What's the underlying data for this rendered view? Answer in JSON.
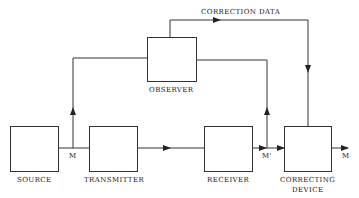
{
  "diagram": {
    "blocks": [
      {
        "id": "source",
        "label": "SOURCE"
      },
      {
        "id": "transmitter",
        "label": "TRANSMITTER"
      },
      {
        "id": "receiver",
        "label": "RECEIVER"
      },
      {
        "id": "observer",
        "label": "OBSERVER"
      },
      {
        "id": "correcting_device",
        "label_line1": "CORRECTING",
        "label_line2": "DEVICE"
      }
    ],
    "signals": {
      "source_out": "M",
      "receiver_out": "M'",
      "corrected_out": "M",
      "correction_link": "CORRECTION DATA"
    },
    "edges": [
      {
        "from": "source",
        "to": "transmitter",
        "label": "M"
      },
      {
        "from": "source",
        "to": "observer",
        "label": "M"
      },
      {
        "from": "transmitter",
        "to": "receiver"
      },
      {
        "from": "receiver",
        "to": "observer",
        "label": "M'"
      },
      {
        "from": "receiver",
        "to": "correcting_device",
        "label": "M'"
      },
      {
        "from": "observer",
        "to": "correcting_device",
        "label": "CORRECTION DATA"
      },
      {
        "from": "correcting_device",
        "to": "output",
        "label": "M"
      }
    ],
    "colors": {
      "line": "#333333",
      "background": "#ffffff"
    }
  }
}
